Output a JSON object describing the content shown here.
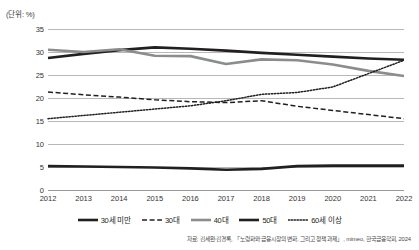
{
  "unit_label": "(단위: %)",
  "source_note": "자료: 김세완·김경록, 「노령화와 금융시장의 변화, 그리고 정책 과제」, mimeo, 한국금융학회, 2024",
  "legend": {
    "items": [
      {
        "label": "30세 미만",
        "style": "solid",
        "color": "#231f20",
        "width": 2.6
      },
      {
        "label": "30대",
        "style": "dashed",
        "color": "#231f20",
        "width": 1.5
      },
      {
        "label": "40대",
        "style": "solid",
        "color": "#8c8c8c",
        "width": 2.6
      },
      {
        "label": "50대",
        "style": "solid",
        "color": "#231f20",
        "width": 2.6
      },
      {
        "label": "60세 이상",
        "style": "dotted",
        "color": "#231f20",
        "width": 1.5
      }
    ]
  },
  "chart_data": {
    "type": "line",
    "title": "",
    "xlabel": "",
    "ylabel": "",
    "unit": "%",
    "grid": true,
    "legend_position": "bottom",
    "ylim": [
      0,
      35
    ],
    "yticks": [
      0,
      5,
      10,
      15,
      20,
      25,
      30,
      35
    ],
    "categories": [
      "2012",
      "2013",
      "2014",
      "2015",
      "2016",
      "2017",
      "2018",
      "2019",
      "2020",
      "2021",
      "2022"
    ],
    "series": [
      {
        "name": "30세 미만",
        "style": "solid",
        "color": "#231f20",
        "values": [
          28.7,
          29.6,
          30.4,
          31.0,
          30.7,
          30.3,
          29.8,
          29.4,
          29.0,
          28.6,
          28.3
        ]
      },
      {
        "name": "30대",
        "style": "dashed",
        "color": "#231f20",
        "values": [
          21.3,
          20.7,
          20.2,
          19.6,
          19.2,
          19.0,
          19.4,
          18.2,
          17.3,
          16.4,
          15.5
        ]
      },
      {
        "name": "40대",
        "style": "solid",
        "color": "#8c8c8c",
        "values": [
          30.5,
          30.0,
          30.6,
          29.2,
          29.1,
          27.4,
          28.4,
          28.2,
          27.3,
          25.9,
          24.8
        ]
      },
      {
        "name": "50대",
        "style": "solid",
        "color": "#231f20",
        "values": [
          5.2,
          5.1,
          5.0,
          4.9,
          4.7,
          4.4,
          4.6,
          5.2,
          5.3,
          5.3,
          5.3
        ]
      },
      {
        "name": "60세 이상",
        "style": "dotted",
        "color": "#231f20",
        "values": [
          15.5,
          16.2,
          16.9,
          17.6,
          18.3,
          19.4,
          20.8,
          21.2,
          22.4,
          25.3,
          28.2
        ]
      }
    ]
  }
}
